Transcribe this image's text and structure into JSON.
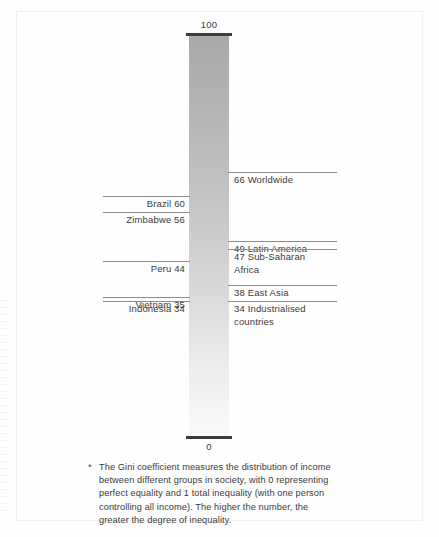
{
  "chart_data": {
    "type": "bar",
    "title": "",
    "subtitle": "",
    "xlabel": "",
    "ylabel": "",
    "ylim": [
      0,
      100
    ],
    "axis_ticks": [
      {
        "value": 100,
        "label": "100",
        "position": "top"
      },
      {
        "value": 0,
        "label": "0",
        "position": "bottom"
      }
    ],
    "grid": false,
    "legend": "none",
    "orientation": "vertical-scale",
    "categories": [
      "Worldwide",
      "Brazil",
      "Zimbabwe",
      "Latin America",
      "Sub-Saharan Africa",
      "Peru",
      "East Asia",
      "Vietnam",
      "Indonesia",
      "Industrialised countries"
    ],
    "values": [
      66,
      60,
      56,
      49,
      47,
      44,
      38,
      35,
      34,
      34
    ],
    "markers": [
      {
        "value": 66,
        "side": "right",
        "number": "66",
        "name": "Worldwide",
        "label": "66 Worldwide"
      },
      {
        "value": 60,
        "side": "left",
        "number": "60",
        "name": "Brazil",
        "label": "Brazil 60"
      },
      {
        "value": 56,
        "side": "left",
        "number": "56",
        "name": "Zimbabwe",
        "label": "Zimbabwe 56"
      },
      {
        "value": 49,
        "side": "right",
        "number": "49",
        "name": "Latin America",
        "label": "49 Latin America"
      },
      {
        "value": 47,
        "side": "right",
        "number": "47",
        "name": "Sub-Saharan Africa",
        "label": "47 Sub-Saharan\nAfrica"
      },
      {
        "value": 44,
        "side": "left",
        "number": "44",
        "name": "Peru",
        "label": "Peru 44"
      },
      {
        "value": 38,
        "side": "right",
        "number": "38",
        "name": "East Asia",
        "label": "38 East Asia"
      },
      {
        "value": 35,
        "side": "left",
        "number": "35",
        "name": "Vietnam",
        "label": "Vietnam 35"
      },
      {
        "value": 34,
        "side": "left",
        "number": "34",
        "name": "Indonesia",
        "label": "Indonesia 34"
      },
      {
        "value": 34,
        "side": "right",
        "number": "34",
        "name": "Industrialised countries",
        "label": "34 Industrialised\ncountries"
      }
    ],
    "colors": {
      "bar_top": "#a9a9a9",
      "bar_bottom": "#fafafa",
      "cap": "#3c3c3c",
      "leader_line": "#8c8c8c",
      "text": "#3a3a3a",
      "page_border": "#f0f0f0",
      "background": "#ffffff"
    }
  },
  "footnote": {
    "marker": "*",
    "text": "The Gini coefficient measures the distribution of income between different groups in society, with 0 representing perfect equality and 1 total inequality (with one person controlling all income).  The higher the number, the greater the degree of inequality."
  }
}
